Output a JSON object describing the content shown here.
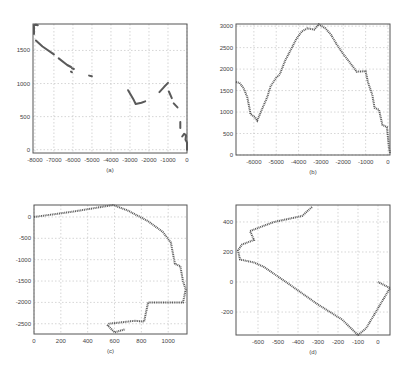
{
  "chart_data": [
    {
      "id": "a",
      "type": "scatter",
      "caption": "(a)",
      "frame": {
        "left": 33,
        "right": 187,
        "top": 24,
        "bottom": 153
      },
      "xlim": [
        -8100,
        0
      ],
      "ylim": [
        -50,
        1900
      ],
      "xticks": [
        -8000,
        -7000,
        -6000,
        -5000,
        -4000,
        -3000,
        -2000,
        -1000,
        0
      ],
      "yticks": [
        0,
        500,
        1000,
        1500
      ],
      "grid": true,
      "segments": [
        [
          [
            -8050,
            1750
          ],
          [
            -8050,
            1880
          ],
          [
            -7950,
            1890
          ],
          [
            -7850,
            1880
          ]
        ],
        [
          [
            -7950,
            1650
          ],
          [
            -7600,
            1560
          ],
          [
            -7000,
            1440
          ]
        ],
        [
          [
            -6750,
            1380
          ],
          [
            -6300,
            1280
          ],
          [
            -6100,
            1250
          ]
        ],
        [
          [
            -6050,
            1230
          ],
          [
            -5950,
            1220
          ]
        ],
        [
          [
            -6100,
            1180
          ],
          [
            -6050,
            1170
          ]
        ],
        [
          [
            -5150,
            1120
          ],
          [
            -5000,
            1110
          ]
        ],
        [
          [
            -3100,
            900
          ],
          [
            -2800,
            750
          ],
          [
            -2700,
            690
          ],
          [
            -2400,
            710
          ],
          [
            -2200,
            730
          ]
        ],
        [
          [
            -1450,
            870
          ],
          [
            -1200,
            950
          ],
          [
            -1000,
            1010
          ]
        ],
        [
          [
            -950,
            880
          ],
          [
            -800,
            780
          ]
        ],
        [
          [
            -700,
            700
          ],
          [
            -500,
            640
          ]
        ],
        [
          [
            -350,
            420
          ],
          [
            -350,
            330
          ]
        ],
        [
          [
            -250,
            200
          ],
          [
            -150,
            240
          ],
          [
            -50,
            220
          ],
          [
            -80,
            150
          ],
          [
            0,
            110
          ],
          [
            0,
            0
          ]
        ]
      ]
    },
    {
      "id": "b",
      "type": "line",
      "caption": "(b)",
      "frame": {
        "left": 236,
        "right": 390,
        "top": 24,
        "bottom": 155
      },
      "xlim": [
        -6800,
        90
      ],
      "ylim": [
        0,
        3050
      ],
      "xticks": [
        -6000,
        -5000,
        -4000,
        -3000,
        -2000,
        -1000,
        0
      ],
      "yticks": [
        0,
        500,
        1000,
        1500,
        2000,
        2500,
        3000
      ],
      "grid": true,
      "series": [
        {
          "name": "trajectory",
          "points": [
            [
              -6800,
              1700
            ],
            [
              -6650,
              1680
            ],
            [
              -6450,
              1550
            ],
            [
              -6300,
              1350
            ],
            [
              -6200,
              1100
            ],
            [
              -6150,
              950
            ],
            [
              -5950,
              880
            ],
            [
              -5850,
              800
            ],
            [
              -5650,
              1050
            ],
            [
              -5400,
              1350
            ],
            [
              -5250,
              1600
            ],
            [
              -5000,
              1800
            ],
            [
              -4850,
              1870
            ],
            [
              -4600,
              2200
            ],
            [
              -4350,
              2450
            ],
            [
              -4100,
              2700
            ],
            [
              -3850,
              2880
            ],
            [
              -3600,
              2950
            ],
            [
              -3300,
              2920
            ],
            [
              -3100,
              3040
            ],
            [
              -2800,
              2950
            ],
            [
              -2550,
              2800
            ],
            [
              -2300,
              2580
            ],
            [
              -2000,
              2350
            ],
            [
              -1700,
              2150
            ],
            [
              -1400,
              1940
            ],
            [
              -1000,
              1950
            ],
            [
              -900,
              1700
            ],
            [
              -700,
              1400
            ],
            [
              -600,
              1100
            ],
            [
              -400,
              1050
            ],
            [
              -250,
              700
            ],
            [
              -50,
              650
            ],
            [
              50,
              150
            ],
            [
              90,
              50
            ]
          ]
        }
      ]
    },
    {
      "id": "c",
      "type": "line",
      "caption": "(c)",
      "frame": {
        "left": 34,
        "right": 187,
        "top": 205,
        "bottom": 334
      },
      "xlim": [
        0,
        1140
      ],
      "ylim": [
        -2740,
        280
      ],
      "xticks": [
        0,
        200,
        400,
        600,
        800,
        1000
      ],
      "yticks": [
        0,
        -500,
        -1000,
        -1500,
        -2000,
        -2500
      ],
      "grid": true,
      "series": [
        {
          "name": "trajectory",
          "points": [
            [
              0,
              0
            ],
            [
              300,
              130
            ],
            [
              590,
              280
            ],
            [
              700,
              150
            ],
            [
              850,
              -100
            ],
            [
              960,
              -350
            ],
            [
              1020,
              -600
            ],
            [
              1050,
              -1100
            ],
            [
              1090,
              -1150
            ],
            [
              1110,
              -1500
            ],
            [
              1130,
              -1700
            ],
            [
              1110,
              -2000
            ],
            [
              850,
              -2000
            ],
            [
              820,
              -2450
            ],
            [
              750,
              -2430
            ],
            [
              560,
              -2500
            ],
            [
              550,
              -2540
            ],
            [
              600,
              -2700
            ],
            [
              680,
              -2630
            ]
          ]
        }
      ]
    },
    {
      "id": "d",
      "type": "line",
      "caption": "(d)",
      "frame": {
        "left": 236,
        "right": 390,
        "top": 205,
        "bottom": 335
      },
      "xlim": [
        -710,
        60
      ],
      "ylim": [
        -353,
        513
      ],
      "xticks": [
        -600,
        -500,
        -400,
        -300,
        -200,
        -100,
        0
      ],
      "yticks": [
        -200,
        0,
        200,
        400
      ],
      "grid": true,
      "series": [
        {
          "name": "trajectory",
          "points": [
            [
              -330,
              500
            ],
            [
              -380,
              440
            ],
            [
              -520,
              400
            ],
            [
              -640,
              340
            ],
            [
              -620,
              280
            ],
            [
              -680,
              250
            ],
            [
              -700,
              210
            ],
            [
              -690,
              150
            ],
            [
              -620,
              130
            ],
            [
              -570,
              100
            ],
            [
              -460,
              0
            ],
            [
              -300,
              -150
            ],
            [
              -180,
              -250
            ],
            [
              -100,
              -353
            ],
            [
              -60,
              -310
            ],
            [
              -20,
              -220
            ],
            [
              60,
              -40
            ],
            [
              0,
              0
            ]
          ]
        }
      ]
    }
  ]
}
